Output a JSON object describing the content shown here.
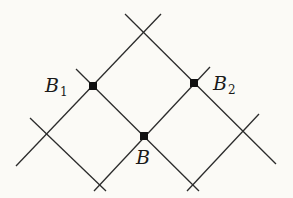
{
  "diagram": {
    "type": "diagonal lattice",
    "colors": {
      "background": "#fbfaf6",
      "line": "#2b2b2b",
      "point": "#111111"
    },
    "lines_down_right": [
      {
        "x1": 125,
        "y1": 14,
        "x2": 276,
        "y2": 164
      },
      {
        "x1": 76,
        "y1": 69,
        "x2": 199,
        "y2": 191
      },
      {
        "x1": 30,
        "y1": 118,
        "x2": 106,
        "y2": 191
      }
    ],
    "lines_up_right": [
      {
        "x1": 16,
        "y1": 166,
        "x2": 161,
        "y2": 14
      },
      {
        "x1": 94,
        "y1": 191,
        "x2": 210,
        "y2": 67
      },
      {
        "x1": 187,
        "y1": 191,
        "x2": 259,
        "y2": 114
      }
    ],
    "points": [
      {
        "id": "B1",
        "x": 93,
        "y": 86
      },
      {
        "id": "B2",
        "x": 194,
        "y": 83
      },
      {
        "id": "B",
        "x": 144,
        "y": 136
      }
    ],
    "labels": {
      "b1": {
        "main": "B",
        "sub": "1"
      },
      "b2": {
        "main": "B",
        "sub": "2"
      },
      "b": {
        "main": "B"
      }
    }
  }
}
